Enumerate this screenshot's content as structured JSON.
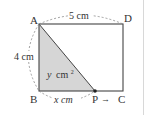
{
  "diagram": {
    "type": "geometry-figure",
    "shape": "rectangle",
    "vertices": [
      {
        "name": "A",
        "label": "A"
      },
      {
        "name": "B",
        "label": "B"
      },
      {
        "name": "C",
        "label": "C"
      },
      {
        "name": "D",
        "label": "D"
      }
    ],
    "moving_point": {
      "name": "P",
      "label": "P",
      "direction_arrow": "→"
    },
    "dimensions": {
      "top": "5 cm",
      "left": "4 cm",
      "bottom_segment": "x cm"
    },
    "shaded_region": {
      "label_var": "y",
      "label_unit": "cm",
      "label_exp": "2",
      "fill": "#d6d6d6"
    },
    "colors": {
      "line": "#444444",
      "dashed": "#888888",
      "shade": "#d6d6d6"
    }
  }
}
